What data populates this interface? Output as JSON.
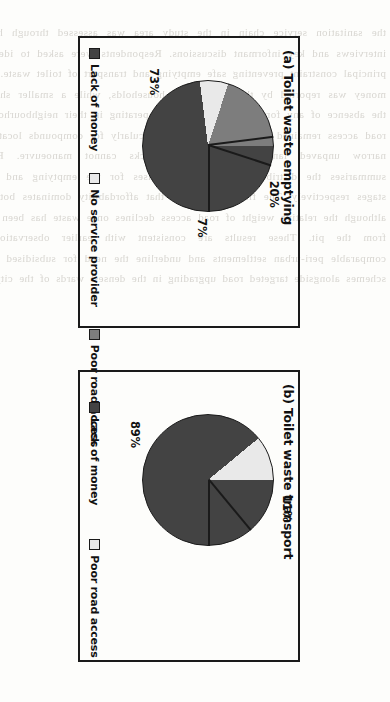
{
  "figure": {
    "orientation_degrees": 90,
    "background_color": "#fdfdfb",
    "frame_color": "#1a1a1a"
  },
  "palette": {
    "lack_of_money": "#434343",
    "no_service_provider": "#e9e9e9",
    "poor_road_access": "#7d7d7d"
  },
  "bleed_text": "the sanitation service chain in the study area was assessed through household interviews and key informant discussions. Respondents were asked to identify the principal constraint preventing safe emptying and transport of toilet waste. Lack of money was reported by the majority of households, while a smaller share cited the absence of any formal service provider operating in their neighbourhood. Poor road access remained a recurrent barrier, particularly for compounds located along narrow unpaved lanes where vacuum trucks cannot manoeuvre. Figure 4 summarises the distribution of these responses for the emptying and transport stages respectively. The findings indicate that affordability dominates both stages, although the relative weight of road access declines once waste has been removed from the pit. These results are consistent with earlier observations from comparable peri-urban settlements and underline the need for subsidised emptying schemes alongside targeted road upgrading in the densest wards of the city centre.",
  "panels": [
    {
      "id": "a",
      "title": "(a) Toilet waste emptying",
      "chart_data": {
        "type": "pie",
        "title": "(a) Toilet waste emptying",
        "labels": [
          "Lack of money",
          "No service provider",
          "Poor road access"
        ],
        "values": [
          73,
          7,
          20
        ],
        "value_labels": [
          "73%",
          "7%",
          "20%"
        ],
        "colors": [
          "#434343",
          "#e9e9e9",
          "#7d7d7d"
        ],
        "legend_position": "bottom",
        "start_angle_degrees": 0,
        "direction": "clockwise"
      },
      "slices": [
        {
          "name": "Lack of money",
          "label": "73%",
          "value": 73,
          "color": "#434343"
        },
        {
          "name": "No service provider",
          "label": "7%",
          "value": 7,
          "color": "#e9e9e9"
        },
        {
          "name": "Poor road access",
          "label": "20%",
          "value": 20,
          "color": "#7d7d7d"
        }
      ],
      "legend": [
        {
          "label": "Lack of money",
          "color": "#434343"
        },
        {
          "label": "No service provider",
          "color": "#e9e9e9"
        },
        {
          "label": "Poor road access",
          "color": "#7d7d7d"
        }
      ]
    },
    {
      "id": "b",
      "title": "(b) Toilet waste transport",
      "chart_data": {
        "type": "pie",
        "title": "(b) Toilet waste transport",
        "labels": [
          "Lack of money",
          "Poor road access"
        ],
        "values": [
          89,
          11
        ],
        "value_labels": [
          "89%",
          "11%"
        ],
        "colors": [
          "#434343",
          "#e9e9e9"
        ],
        "legend_position": "bottom",
        "start_angle_degrees": 0,
        "direction": "clockwise"
      },
      "slices": [
        {
          "name": "Lack of money",
          "label": "89%",
          "value": 89,
          "color": "#434343"
        },
        {
          "name": "Poor road access",
          "label": "11%",
          "value": 11,
          "color": "#e9e9e9"
        }
      ],
      "legend": [
        {
          "label": "Lack of money",
          "color": "#434343"
        },
        {
          "label": "Poor road access",
          "color": "#e9e9e9"
        }
      ]
    }
  ]
}
